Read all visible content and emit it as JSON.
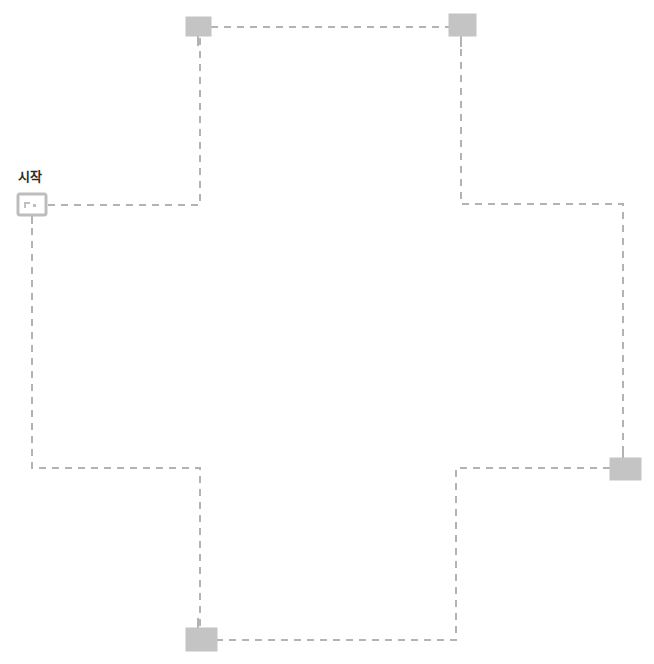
{
  "canvas": {
    "width": 654,
    "height": 664,
    "background": "#ffffff"
  },
  "colors": {
    "connector": "#b3b3b3",
    "node_fill": "#c4c4c4",
    "node_stroke": "#bdbdbd",
    "start_fill": "#ffffff",
    "start_stroke": "#bdbdbd",
    "start_glyph": "#c0c0c0",
    "label_text": "#2b2b2b",
    "clipped_text": "#e9e9ee"
  },
  "header": {
    "clipped_text": "— ———  —  —— — — —— ——",
    "visible": true
  },
  "labels": [
    {
      "id": "start-label",
      "text": "시작",
      "x": 18,
      "y": 166
    }
  ],
  "nodes": [
    {
      "id": "start-node",
      "name": "start",
      "label": "시작",
      "shape": "rounded-rect-outline",
      "filled": false,
      "x": 18,
      "y": 194,
      "width": 28,
      "height": 21
    },
    {
      "id": "node-top-left",
      "name": "top-left-node",
      "label": "",
      "shape": "rect",
      "filled": true,
      "x": 186,
      "y": 17,
      "width": 25,
      "height": 19
    },
    {
      "id": "node-top-right",
      "name": "top-right-node",
      "label": "",
      "shape": "rect",
      "filled": true,
      "x": 449,
      "y": 14,
      "width": 27,
      "height": 22
    },
    {
      "id": "node-right",
      "name": "right-node",
      "label": "",
      "shape": "rect",
      "filled": true,
      "x": 610,
      "y": 458,
      "width": 31,
      "height": 22
    },
    {
      "id": "node-bottom",
      "name": "bottom-node",
      "label": "",
      "shape": "rect",
      "filled": true,
      "x": 186,
      "y": 628,
      "width": 31,
      "height": 23
    }
  ],
  "connectors": [
    {
      "id": "conn-start-to-topleft",
      "name": "start-to-top-left",
      "points": "48,205 200,205 200,36",
      "dashed": true
    },
    {
      "id": "conn-topleft-to-topright",
      "name": "top-left-to-top-right",
      "points": "211,27 449,27",
      "dashed": true
    },
    {
      "id": "conn-topright-to-right",
      "name": "top-right-to-right-node",
      "points": "461,36 461,204 623,204 623,458",
      "dashed": true
    },
    {
      "id": "conn-start-down-to-bottom",
      "name": "start-down-to-bottom-branch",
      "points": "32,215 32,468 200,468 200,628",
      "dashed": true
    },
    {
      "id": "conn-rightnode-to-bottomnode",
      "name": "right-node-to-bottom-node",
      "points": "610,468 456,468 456,640 217,640",
      "dashed": true
    }
  ],
  "stems": [
    {
      "id": "stem-start",
      "name": "start-node-stem",
      "x": 32,
      "y1": 215,
      "y2": 224
    },
    {
      "id": "stem-top-left",
      "name": "top-left-node-stem",
      "x": 198,
      "y1": 36,
      "y2": 46
    },
    {
      "id": "stem-top-right",
      "name": "top-right-node-stem",
      "x": 461,
      "y1": 36,
      "y2": 47
    },
    {
      "id": "stem-right",
      "name": "right-node-stem",
      "x": 623,
      "y1": 450,
      "y2": 460
    },
    {
      "id": "stem-bottom",
      "name": "bottom-node-stem",
      "x": 198,
      "y1": 618,
      "y2": 629
    }
  ],
  "style": {
    "dash_pattern": "7 6",
    "stroke_width": 2
  }
}
